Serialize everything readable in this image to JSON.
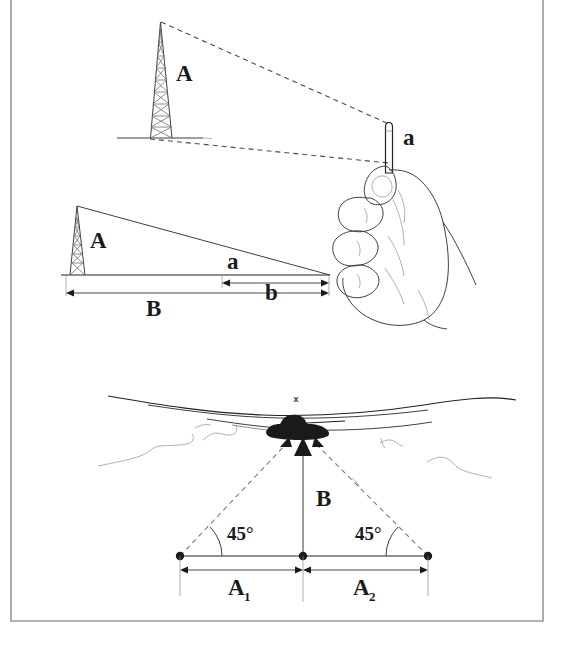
{
  "figure": {
    "panels": [
      {
        "id": "panel-top",
        "name": "stick-sighting-panel",
        "description": "Observer holding a vertical stick at arm's length sighting a lattice tower",
        "labels": {
          "tower_height": "A",
          "stick_height": "a"
        }
      },
      {
        "id": "panel-middle",
        "name": "similar-triangles-panel",
        "description": "Similar triangles schematic: tower of height A at distance B, stick of height a at distance b",
        "labels": {
          "tower_height": "A",
          "stick_height": "a",
          "distance_to_tower": "B",
          "distance_to_stick": "b"
        }
      },
      {
        "id": "panel-bottom",
        "name": "forty-five-degree-triangulation-panel",
        "description": "Plan view: target marked with x on a ridgeline, sighted from two baseline stations at 45 degrees",
        "labels": {
          "target_mark": "x",
          "range_to_target": "B",
          "baseline_left": "A",
          "baseline_left_sub": "1",
          "baseline_right": "A",
          "baseline_right_sub": "2",
          "angle_left": "45°",
          "angle_right": "45°"
        }
      }
    ],
    "colors": {
      "ink": "#3f3f3f",
      "ink_dark": "#222222",
      "dashed": "#4a4a4a",
      "frame": "#9a9a9a",
      "silhouette": "#1a1a1a",
      "background": "#ffffff"
    }
  }
}
